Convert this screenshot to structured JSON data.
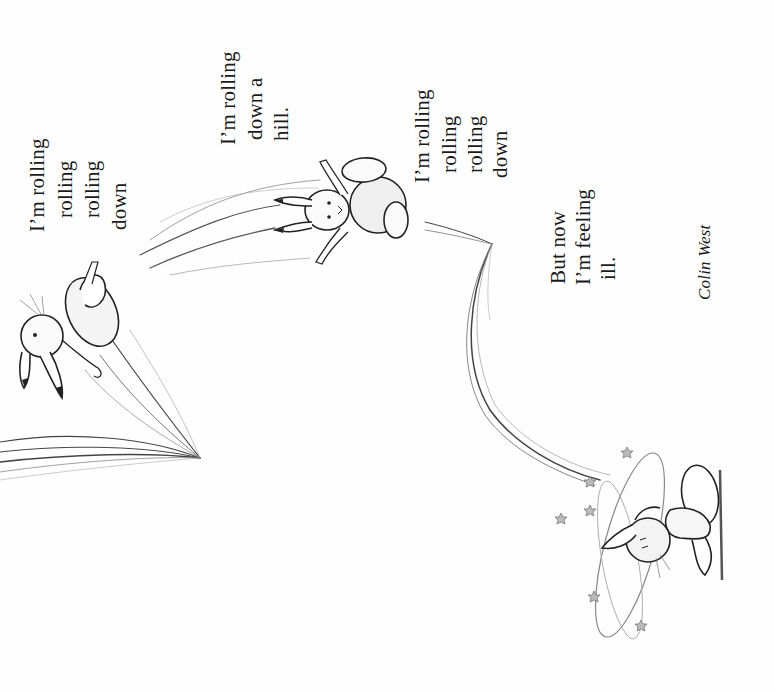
{
  "poem": {
    "stanzas": [
      {
        "lines": [
          "I’m rolling",
          "rolling",
          "rolling",
          "down"
        ]
      },
      {
        "lines": [
          "I’m rolling",
          "down a",
          "hill."
        ]
      },
      {
        "lines": [
          "I’m rolling",
          "rolling",
          "rolling",
          "down"
        ]
      },
      {
        "lines": [
          "But now",
          "I’m feeling",
          "ill."
        ]
      }
    ],
    "author": "Colin West"
  },
  "illustrations": [
    {
      "name": "rabbit-rolling-1",
      "description": "rabbit tumbling upside down with motion streaks"
    },
    {
      "name": "rabbit-rolling-2",
      "description": "rabbit flying through air with motion streaks"
    },
    {
      "name": "motion-arc",
      "description": "curved motion streak arc"
    },
    {
      "name": "rabbit-dizzy",
      "description": "dizzy rabbit sitting on ground with stars"
    }
  ],
  "colors": {
    "background": "#fefefe",
    "ink": "#1a1a1a",
    "pencil": "#555555"
  }
}
